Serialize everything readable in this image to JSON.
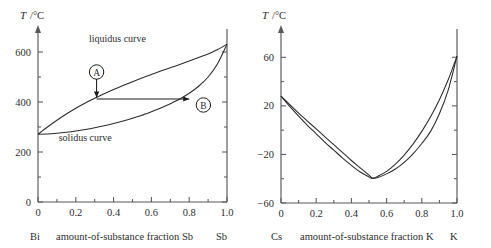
{
  "figure": {
    "panels": [
      "left",
      "right"
    ]
  },
  "chart_data": [
    {
      "type": "line",
      "panel_id": "bismuth-antimony-phase-diagram",
      "title": "",
      "ylabel": "T /°C",
      "ylabel_symbol": "T",
      "ylabel_unit": "/°C",
      "xlabel": "amount-of-substance fraction Sb",
      "xlabel_left_component": "Bi",
      "xlabel_right_component": "Sb",
      "xlim": [
        0,
        1.0
      ],
      "ylim": [
        0,
        680
      ],
      "xticks": [
        0,
        0.2,
        0.4,
        0.6,
        0.8,
        1.0
      ],
      "xticklabels": [
        "0",
        "0.2",
        "0.4",
        "0.6",
        "0.8",
        "1.0"
      ],
      "xminor_ticks": [
        0.1,
        0.3,
        0.5,
        0.7,
        0.9
      ],
      "yticks": [
        0,
        200,
        400,
        600
      ],
      "yticklabels": [
        "0",
        "200",
        "400",
        "600"
      ],
      "yminor_ticks": [
        100,
        300,
        500
      ],
      "grid": false,
      "legend_position": "inline-labels",
      "series": [
        {
          "name": "liquidus curve",
          "label": "liquidus curve",
          "label_x": 0.42,
          "label_y": 640,
          "x": [
            0.0,
            0.05,
            0.1,
            0.15,
            0.2,
            0.25,
            0.3,
            0.35,
            0.4,
            0.45,
            0.5,
            0.55,
            0.6,
            0.65,
            0.7,
            0.75,
            0.8,
            0.85,
            0.9,
            0.95,
            1.0
          ],
          "y": [
            271,
            300,
            327,
            352,
            375,
            396,
            415,
            433,
            450,
            466,
            481,
            496,
            510,
            524,
            537,
            550,
            564,
            578,
            592,
            610,
            631
          ]
        },
        {
          "name": "solidus curve",
          "label": "solidus curve",
          "label_x": 0.25,
          "label_y": 245,
          "x": [
            0.0,
            0.05,
            0.1,
            0.15,
            0.2,
            0.25,
            0.3,
            0.35,
            0.4,
            0.45,
            0.5,
            0.55,
            0.6,
            0.65,
            0.7,
            0.75,
            0.8,
            0.85,
            0.9,
            0.95,
            1.0
          ],
          "y": [
            271,
            272,
            275,
            279,
            284,
            290,
            297,
            305,
            314,
            324,
            335,
            347,
            361,
            376,
            393,
            412,
            435,
            463,
            500,
            553,
            631
          ]
        }
      ],
      "annotations": [
        {
          "label": "A",
          "type": "circled-label-with-arrow",
          "circle_x": 0.31,
          "circle_y": 520,
          "arrow_from_x": 0.31,
          "arrow_from_y": 492,
          "arrow_to_x": 0.31,
          "arrow_to_y": 418
        },
        {
          "label": "B",
          "type": "circled-label-with-arrow",
          "circle_x": 0.875,
          "circle_y": 388,
          "arrow_from_x": 0.31,
          "arrow_from_y": 412,
          "arrow_to_x": 0.8,
          "arrow_to_y": 412
        }
      ]
    },
    {
      "type": "line",
      "panel_id": "cesium-potassium-phase-diagram",
      "title": "",
      "ylabel": "T /°C",
      "ylabel_symbol": "T",
      "ylabel_unit": "/°C",
      "xlabel": "amount-of-substance fraction K",
      "xlabel_left_component": "Cs",
      "xlabel_right_component": "K",
      "xlim": [
        0,
        1.0
      ],
      "ylim": [
        -60,
        80
      ],
      "xticks": [
        0,
        0.2,
        0.4,
        0.6,
        0.8,
        1.0
      ],
      "xticklabels": [
        "0",
        "0.2",
        "0.4",
        "0.6",
        "0.8",
        "1.0"
      ],
      "xminor_ticks": [
        0.1,
        0.3,
        0.5,
        0.7,
        0.9
      ],
      "yticks": [
        -60,
        -20,
        20,
        60
      ],
      "yticklabels": [
        "−60",
        "−20",
        "20",
        "60"
      ],
      "yminor_ticks": [
        -40,
        0,
        40
      ],
      "grid": false,
      "legend_position": "none",
      "series": [
        {
          "name": "liquidus curve",
          "label": "",
          "x": [
            0.0,
            0.05,
            0.1,
            0.15,
            0.2,
            0.25,
            0.3,
            0.35,
            0.4,
            0.45,
            0.5,
            0.52,
            0.55,
            0.6,
            0.65,
            0.7,
            0.75,
            0.8,
            0.85,
            0.9,
            0.95,
            1.0
          ],
          "y": [
            28,
            21,
            14,
            7.5,
            1,
            -5.5,
            -12,
            -18.5,
            -25,
            -31,
            -37,
            -39.5,
            -38,
            -34,
            -28,
            -20.5,
            -11.5,
            -1,
            11,
            25,
            41.5,
            61
          ]
        },
        {
          "name": "solidus curve",
          "label": "",
          "x": [
            0.0,
            0.05,
            0.1,
            0.15,
            0.2,
            0.25,
            0.3,
            0.35,
            0.4,
            0.45,
            0.5,
            0.52,
            0.55,
            0.6,
            0.65,
            0.7,
            0.75,
            0.8,
            0.85,
            0.9,
            0.95,
            1.0
          ],
          "y": [
            28,
            19.5,
            11.5,
            4,
            -3,
            -10,
            -16.5,
            -23,
            -29,
            -34.5,
            -38.5,
            -39.8,
            -39,
            -36,
            -32,
            -26.5,
            -19.5,
            -11,
            -1,
            13.5,
            33,
            61
          ]
        }
      ],
      "annotations": []
    }
  ]
}
